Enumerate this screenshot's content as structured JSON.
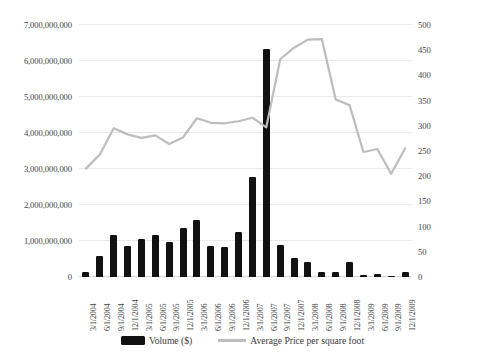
{
  "chart_data": {
    "type": "bar",
    "title": "",
    "xlabel": "",
    "ylabel": "",
    "categories": [
      "3/1/2004",
      "6/1/2004",
      "9/1/2004",
      "12/1/2004",
      "3/1/2005",
      "6/1/2005",
      "9/1/2005",
      "12/1/2005",
      "3/1/2006",
      "6/1/2006",
      "9/1/2006",
      "12/1/2006",
      "3/1/2007",
      "6/1/2007",
      "9/1/2007",
      "12/1/2007",
      "3/1/2008",
      "6/1/2008",
      "9/1/2008",
      "12/1/2008",
      "3/1/2009",
      "6/1/2009",
      "9/1/2009",
      "12/1/2009"
    ],
    "series": [
      {
        "name": "Volume ($)",
        "type": "bar",
        "axis": "left",
        "color": "#111111",
        "values": [
          140000000,
          590000000,
          1170000000,
          870000000,
          1060000000,
          1160000000,
          960000000,
          1360000000,
          1580000000,
          860000000,
          820000000,
          1250000000,
          2780000000,
          6320000000,
          900000000,
          520000000,
          420000000,
          130000000,
          150000000,
          430000000,
          60000000,
          70000000,
          40000000,
          130000000
        ]
      },
      {
        "name": "Average Price per square foot",
        "type": "line",
        "axis": "right",
        "color": "#bdbdbd",
        "values": [
          215,
          243,
          295,
          283,
          276,
          281,
          264,
          277,
          315,
          306,
          305,
          309,
          316,
          297,
          432,
          455,
          471,
          472,
          352,
          341,
          248,
          254,
          205,
          255
        ]
      }
    ],
    "y_left": {
      "min": 0,
      "max": 7000000000,
      "step": 1000000000,
      "ticks": [
        "0",
        "1,000,000,000",
        "2,000,000,000",
        "3,000,000,000",
        "4,000,000,000",
        "5,000,000,000",
        "6,000,000,000",
        "7,000,000,000"
      ]
    },
    "y_right": {
      "min": 0,
      "max": 500,
      "step": 50,
      "ticks": [
        "0",
        "50",
        "100",
        "150",
        "200",
        "250",
        "300",
        "350",
        "400",
        "450",
        "500"
      ]
    },
    "grid": true,
    "legend_position": "bottom"
  },
  "legend": {
    "bar_label": "Volume ($)",
    "line_label": "Average Price per square foot"
  },
  "colors": {
    "bar": "#111111",
    "line": "#bdbdbd",
    "grid": "#e9e9e9",
    "text": "#3f3f3f",
    "background": "#ffffff"
  }
}
